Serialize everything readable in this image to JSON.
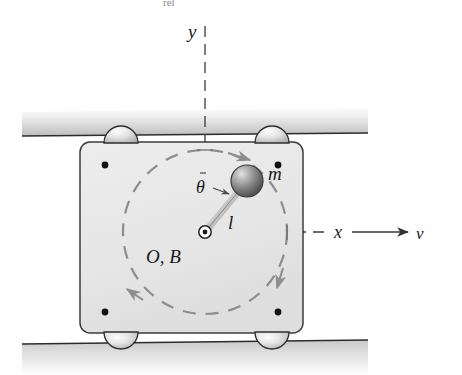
{
  "figure": {
    "title_fragment": "rel",
    "colors": {
      "ink": "#1a1a1a",
      "dashed_gray": "#8d8d8d",
      "cart_fill": "#e9e9e9",
      "rail_light": "#f2f2f2",
      "rail_dark": "#a8a8a8",
      "sphere_light": "#d8d8d8",
      "sphere_dark": "#4a4a4a",
      "wheel_light": "#f4f4f4",
      "wheel_dark": "#9a9a9a",
      "corner_dot": "#111111"
    }
  },
  "labels": {
    "y_axis": "y",
    "x_axis": "x",
    "velocity": "v",
    "mass": "m",
    "rod_length": "l",
    "angle": "θ",
    "pivot": "O, B"
  },
  "geometry": {
    "pivot": {
      "x": 205,
      "y": 232
    },
    "mass_center": {
      "x": 245,
      "y": 182
    },
    "rod_length_px": 64,
    "path_radius_px": 82,
    "cart": {
      "left": 80,
      "top": 142,
      "right": 303,
      "bottom": 333,
      "corner_radius": 9
    },
    "rail_left": 22,
    "rail_right": 368,
    "top_rail": {
      "top": 110,
      "bottom": 136
    },
    "bottom_rail": {
      "top": 340,
      "bottom": 375
    },
    "wheel_radius": 16,
    "velocity_arrow": {
      "from_x": 350,
      "to_x": 405,
      "y": 232
    }
  }
}
